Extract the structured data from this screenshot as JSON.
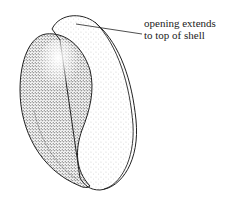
{
  "figure": {
    "subject": "shell",
    "annotations": [
      {
        "line1": "opening extends",
        "line2": "to top of shell"
      }
    ],
    "colors": {
      "ink": "#222222",
      "paper": "#ffffff"
    }
  }
}
